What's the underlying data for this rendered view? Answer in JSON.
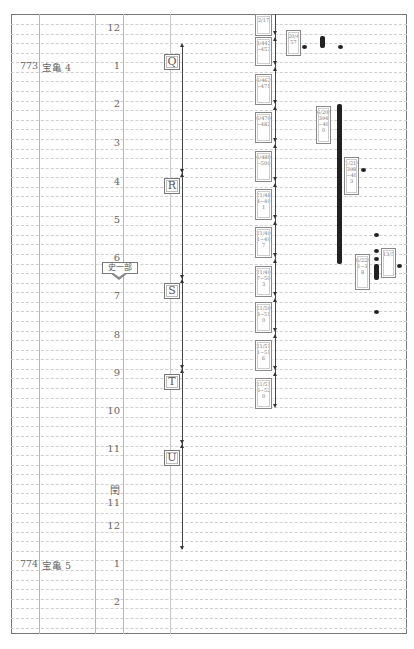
{
  "diagram": {
    "type": "chronological-timeline",
    "years": [
      {
        "year": "773",
        "era": "宝亀 4",
        "y": 66
      },
      {
        "year": "774",
        "era": "宝亀 5",
        "y": 564
      }
    ],
    "months": [
      {
        "label": "12",
        "y": 28
      },
      {
        "label": "1",
        "y": 66
      },
      {
        "label": "2",
        "y": 104
      },
      {
        "label": "3",
        "y": 143
      },
      {
        "label": "4",
        "y": 182
      },
      {
        "label": "5",
        "y": 220
      },
      {
        "label": "6",
        "y": 258
      },
      {
        "label": "7",
        "y": 296
      },
      {
        "label": "8",
        "y": 335
      },
      {
        "label": "9",
        "y": 373
      },
      {
        "label": "10",
        "y": 411
      },
      {
        "label": "11",
        "y": 449
      },
      {
        "label": "閏 11",
        "y": 488
      },
      {
        "label": "12",
        "y": 526
      },
      {
        "label": "1",
        "y": 564
      },
      {
        "label": "2",
        "y": 602
      }
    ],
    "periods": [
      {
        "label": "Q",
        "y": 54
      },
      {
        "label": "R",
        "y": 178
      },
      {
        "label": "S",
        "y": 283
      },
      {
        "label": "T",
        "y": 374
      },
      {
        "label": "U",
        "y": 450
      }
    ],
    "callout": {
      "label": "史一部"
    },
    "docboxes": [
      {
        "text": "2/17",
        "y": 14,
        "h": 22
      },
      {
        "text": "3/442~453",
        "y": 37,
        "h": 29
      },
      {
        "text": "6/462~471",
        "y": 74,
        "h": 31
      },
      {
        "text": "6/470~482",
        "y": 112,
        "h": 31
      },
      {
        "text": "6/480~509",
        "y": 151,
        "h": 31
      },
      {
        "text": "21/484~491",
        "y": 189,
        "h": 31
      },
      {
        "text": "21/491~497",
        "y": 227,
        "h": 31
      },
      {
        "text": "21/497~503",
        "y": 266,
        "h": 31
      },
      {
        "text": "21/503~510",
        "y": 302,
        "h": 31
      },
      {
        "text": "21/511~516",
        "y": 340,
        "h": 31
      },
      {
        "text": "21/516~520",
        "y": 378,
        "h": 31
      }
    ],
    "side_boxes": [
      {
        "text": "20/457",
        "x": 286,
        "y": 30,
        "w": 15,
        "h": 26
      },
      {
        "text": "6/20/394~400",
        "x": 316,
        "y": 106,
        "w": 15,
        "h": 38
      },
      {
        "text": "1/21/398~403",
        "x": 344,
        "y": 157,
        "w": 15,
        "h": 38
      },
      {
        "text": "6/22/1~38",
        "x": 355,
        "y": 254,
        "w": 15,
        "h": 36
      },
      {
        "text": "13/5",
        "x": 381,
        "y": 248,
        "w": 15,
        "h": 30
      }
    ]
  }
}
